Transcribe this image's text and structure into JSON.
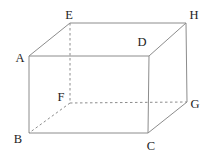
{
  "figure": {
    "type": "cuboid-wireframe",
    "background_color": "#ffffff",
    "line_color": "#8c8c8c",
    "label_color": "#222222",
    "canvas": {
      "width": 210,
      "height": 159
    },
    "vertices": {
      "A": {
        "label": "A",
        "x": 29,
        "y": 56,
        "label_x": 20,
        "label_y": 62
      },
      "B": {
        "label": "B",
        "x": 29,
        "y": 133,
        "label_x": 18,
        "label_y": 143
      },
      "C": {
        "label": "C",
        "x": 148,
        "y": 133,
        "label_x": 151,
        "label_y": 150
      },
      "D": {
        "label": "D",
        "x": 149,
        "y": 56,
        "label_x": 142,
        "label_y": 46
      },
      "E": {
        "label": "E",
        "x": 70,
        "y": 23,
        "label_x": 69,
        "label_y": 19
      },
      "F": {
        "label": "F",
        "x": 70,
        "y": 103,
        "label_x": 61,
        "label_y": 101
      },
      "G": {
        "label": "G",
        "x": 187,
        "y": 102,
        "label_x": 195,
        "label_y": 108
      },
      "H": {
        "label": "H",
        "x": 186,
        "y": 23,
        "label_x": 194,
        "label_y": 19
      }
    },
    "edges": [
      {
        "from": "A",
        "to": "D",
        "style": "solid"
      },
      {
        "from": "A",
        "to": "B",
        "style": "solid"
      },
      {
        "from": "B",
        "to": "C",
        "style": "solid"
      },
      {
        "from": "C",
        "to": "D",
        "style": "solid"
      },
      {
        "from": "A",
        "to": "E",
        "style": "solid"
      },
      {
        "from": "D",
        "to": "H",
        "style": "solid"
      },
      {
        "from": "E",
        "to": "H",
        "style": "solid"
      },
      {
        "from": "H",
        "to": "G",
        "style": "solid"
      },
      {
        "from": "C",
        "to": "G",
        "style": "solid"
      },
      {
        "from": "E",
        "to": "F",
        "style": "dashed"
      },
      {
        "from": "F",
        "to": "G",
        "style": "dashed"
      },
      {
        "from": "F",
        "to": "B",
        "style": "dashed"
      }
    ],
    "dash_pattern": "2.5,2.5",
    "stroke_width": 1
  }
}
